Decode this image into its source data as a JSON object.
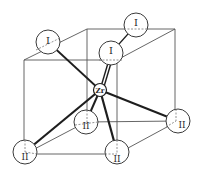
{
  "diagram": {
    "type": "crystal-structure-unit-cell",
    "colors": {
      "line": "#555555",
      "bond": "#1e1e1e",
      "atom_fill": "#ffffff",
      "atom_stroke": "#3a3a3a",
      "dashed": "#777777"
    },
    "center_atom": {
      "label": "Zr",
      "x": 100,
      "y": 90,
      "r": 6.5
    },
    "atoms_I": [
      {
        "label": "I",
        "x": 48,
        "y": 42,
        "r": 12
      },
      {
        "label": "I",
        "x": 136,
        "y": 25,
        "r": 12
      },
      {
        "label": "I",
        "x": 111,
        "y": 53,
        "r": 12
      }
    ],
    "atoms_II": [
      {
        "label": "II",
        "x": 25,
        "y": 152,
        "r": 12
      },
      {
        "label": "II",
        "x": 86,
        "y": 122,
        "r": 12
      },
      {
        "label": "II",
        "x": 117,
        "y": 152,
        "r": 12
      },
      {
        "label": "II",
        "x": 178,
        "y": 121,
        "r": 12
      }
    ]
  }
}
